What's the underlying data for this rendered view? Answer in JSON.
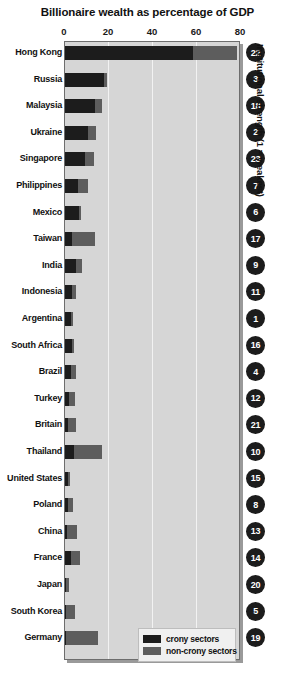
{
  "chart_data": {
    "type": "bar",
    "orientation": "horizontal",
    "stacked": true,
    "title": "Billionaire wealth as percentage of GDP",
    "xlabel": "",
    "ylabel": "",
    "xlim": [
      0,
      80
    ],
    "xticks": [
      0,
      20,
      40,
      60,
      80
    ],
    "grid": true,
    "legend_position": "bottom-right",
    "series": [
      {
        "name": "crony sectors",
        "color": "#1c1c1c",
        "values": [
          58.0,
          17.5,
          13.5,
          10.5,
          9.0,
          6.0,
          6.5,
          3.0,
          5.0,
          3.0,
          2.5,
          3.0,
          2.5,
          2.0,
          1.5,
          4.0,
          1.5,
          1.5,
          1.0,
          2.5,
          0.5,
          0.5,
          0.5
        ]
      },
      {
        "name": "non-crony sectors",
        "color": "#5d5d5d",
        "values": [
          20.0,
          1.5,
          3.5,
          3.5,
          4.0,
          4.5,
          1.0,
          10.5,
          2.5,
          2.0,
          1.0,
          1.0,
          2.5,
          2.5,
          3.5,
          13.0,
          1.0,
          2.0,
          4.5,
          4.5,
          1.5,
          4.0,
          14.5
        ]
      }
    ],
    "categories": [
      "Hong Kong",
      "Russia",
      "Malaysia",
      "Ukraine",
      "Singapore",
      "Philippines",
      "Mexico",
      "Taiwan",
      "India",
      "Indonesia",
      "Argentina",
      "South Africa",
      "Brazil",
      "Turkey",
      "Britain",
      "Thailand",
      "United States",
      "Poland",
      "China",
      "France",
      "Japan",
      "South Korea",
      "Germany"
    ],
    "annotations": {
      "caption": "Institutional strength (1 = weakest)",
      "badges": [
        22,
        3,
        18,
        2,
        23,
        7,
        6,
        17,
        9,
        11,
        1,
        16,
        4,
        12,
        21,
        10,
        15,
        8,
        13,
        14,
        20,
        5,
        19
      ]
    },
    "legend": [
      {
        "label": "crony sectors",
        "color": "#1c1c1c"
      },
      {
        "label": "non-crony sectors",
        "color": "#5d5d5d"
      }
    ]
  },
  "colors": {
    "plot_background": "#d6d6d6",
    "gridline": "#f2f2f2",
    "crony": "#1c1c1c",
    "non_crony": "#5d5d5d",
    "badge_fill": "#1c1c1c",
    "badge_text": "#ffffff",
    "page_background": "#ffffff"
  }
}
